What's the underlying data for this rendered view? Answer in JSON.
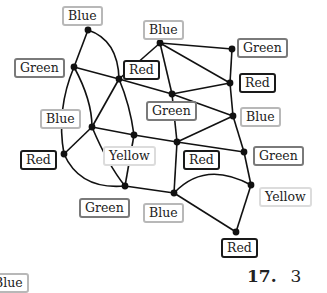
{
  "problem": {
    "number": "17.",
    "answer": "3"
  },
  "cropped_label": {
    "text": "Blue",
    "color": "blue"
  },
  "nodes": [
    {
      "id": 1,
      "x": 88,
      "y": 30,
      "color": "Blue"
    },
    {
      "id": 2,
      "x": 74,
      "y": 67,
      "color": "Green"
    },
    {
      "id": 3,
      "x": 119,
      "y": 79,
      "color": "Red"
    },
    {
      "id": 4,
      "x": 160,
      "y": 43,
      "color": "Blue"
    },
    {
      "id": 5,
      "x": 232,
      "y": 49,
      "color": "Green"
    },
    {
      "id": 6,
      "x": 230,
      "y": 83,
      "color": "Red"
    },
    {
      "id": 7,
      "x": 172,
      "y": 94,
      "color": "Green"
    },
    {
      "id": 8,
      "x": 233,
      "y": 116,
      "color": "Blue"
    },
    {
      "id": 9,
      "x": 92,
      "y": 127,
      "color": "Blue"
    },
    {
      "id": 10,
      "x": 134,
      "y": 135,
      "color": "Yellow"
    },
    {
      "id": 11,
      "x": 177,
      "y": 142,
      "color": "Red"
    },
    {
      "id": 12,
      "x": 64,
      "y": 154,
      "color": "Red"
    },
    {
      "id": 13,
      "x": 244,
      "y": 152,
      "color": "Green"
    },
    {
      "id": 14,
      "x": 125,
      "y": 186,
      "color": "Green"
    },
    {
      "id": 15,
      "x": 251,
      "y": 185,
      "color": "Yellow"
    },
    {
      "id": 16,
      "x": 174,
      "y": 193,
      "color": "Blue"
    },
    {
      "id": 17,
      "x": 236,
      "y": 232,
      "color": "Red"
    }
  ],
  "labels": [
    {
      "text": "Blue",
      "cls": "blue",
      "x": 62,
      "y": 6
    },
    {
      "text": "Green",
      "cls": "green",
      "x": 14,
      "y": 58
    },
    {
      "text": "Red",
      "cls": "red",
      "x": 123,
      "y": 60
    },
    {
      "text": "Blue",
      "cls": "blue",
      "x": 143,
      "y": 20
    },
    {
      "text": "Green",
      "cls": "green",
      "x": 237,
      "y": 38
    },
    {
      "text": "Red",
      "cls": "red",
      "x": 239,
      "y": 73
    },
    {
      "text": "Green",
      "cls": "green",
      "x": 146,
      "y": 101
    },
    {
      "text": "Blue",
      "cls": "blue",
      "x": 240,
      "y": 107
    },
    {
      "text": "Blue",
      "cls": "blue",
      "x": 40,
      "y": 109
    },
    {
      "text": "Yellow",
      "cls": "yellow",
      "x": 103,
      "y": 146
    },
    {
      "text": "Red",
      "cls": "red",
      "x": 183,
      "y": 150
    },
    {
      "text": "Red",
      "cls": "red",
      "x": 20,
      "y": 150
    },
    {
      "text": "Green",
      "cls": "green",
      "x": 253,
      "y": 146
    },
    {
      "text": "Green",
      "cls": "green",
      "x": 79,
      "y": 198
    },
    {
      "text": "Yellow",
      "cls": "yellow",
      "x": 259,
      "y": 187
    },
    {
      "text": "Blue",
      "cls": "blue",
      "x": 143,
      "y": 203
    },
    {
      "text": "Red",
      "cls": "red",
      "x": 221,
      "y": 238
    }
  ]
}
